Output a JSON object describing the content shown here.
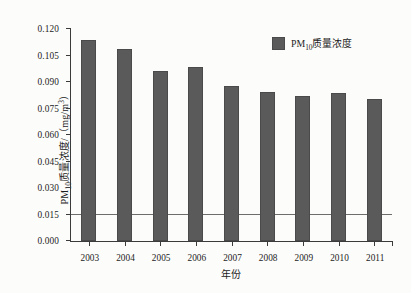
{
  "chart_data": {
    "type": "bar",
    "title": "",
    "subtitle": "",
    "xlabel": "年份",
    "ylabel_parts": {
      "prefix": "PM",
      "subscript": "10",
      "middle": "质量浓度/（mg/m",
      "superscript": "3",
      "suffix": "）"
    },
    "ylabel": "PM10质量浓度/（mg/m3）",
    "categories": [
      "2003",
      "2004",
      "2005",
      "2006",
      "2007",
      "2008",
      "2009",
      "2010",
      "2011"
    ],
    "values": [
      0.1135,
      0.1085,
      0.096,
      0.0985,
      0.088,
      0.0845,
      0.082,
      0.084,
      0.0805
    ],
    "series": [
      {
        "name": "PM10质量浓度",
        "values": [
          0.1135,
          0.1085,
          0.096,
          0.0985,
          0.088,
          0.0845,
          0.082,
          0.084,
          0.0805
        ]
      }
    ],
    "ylim": [
      0.0,
      0.12
    ],
    "xlim_categories": 9,
    "ytick_values": [
      0.0,
      0.015,
      0.03,
      0.045,
      0.06,
      0.075,
      0.09,
      0.105,
      0.12
    ],
    "ytick_labels": [
      "0.000",
      "0.015",
      "0.030",
      "0.045",
      "0.060",
      "0.075",
      "0.090",
      "0.105",
      "0.120"
    ],
    "grid": false,
    "legend_position": "top-right",
    "legend": [
      {
        "label_prefix": "PM",
        "label_subscript": "10",
        "label_suffix": "质量浓度",
        "label": "PM10质量浓度",
        "color": "#5a5a5a"
      }
    ],
    "annotations": [
      {
        "name": "threshold-line",
        "type": "hline",
        "value": 0.0148,
        "color": "#6d6d6d"
      }
    ],
    "colors": {
      "bar": "#5a5a5a",
      "bar_border": "#4a4a4a",
      "axis": "#3b3b3b",
      "text": "#1d1d1d",
      "background": "#fcfcfa",
      "threshold": "#6d6d6d"
    }
  }
}
